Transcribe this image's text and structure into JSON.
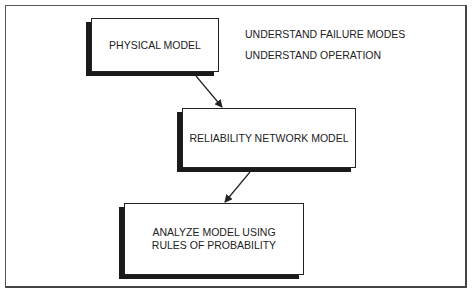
{
  "diagram": {
    "boxes": [
      {
        "id": "physical",
        "label": "PHYSICAL MODEL"
      },
      {
        "id": "network",
        "label": "RELIABILITY NETWORK MODEL"
      },
      {
        "id": "analyze",
        "line1": "ANALYZE MODEL USING",
        "line2": "RULES OF PROBABILITY"
      }
    ],
    "notes": [
      "UNDERSTAND FAILURE MODES",
      "UNDERSTAND OPERATION"
    ],
    "arrows": [
      {
        "from": "physical",
        "to": "network"
      },
      {
        "from": "network",
        "to": "analyze"
      }
    ]
  }
}
